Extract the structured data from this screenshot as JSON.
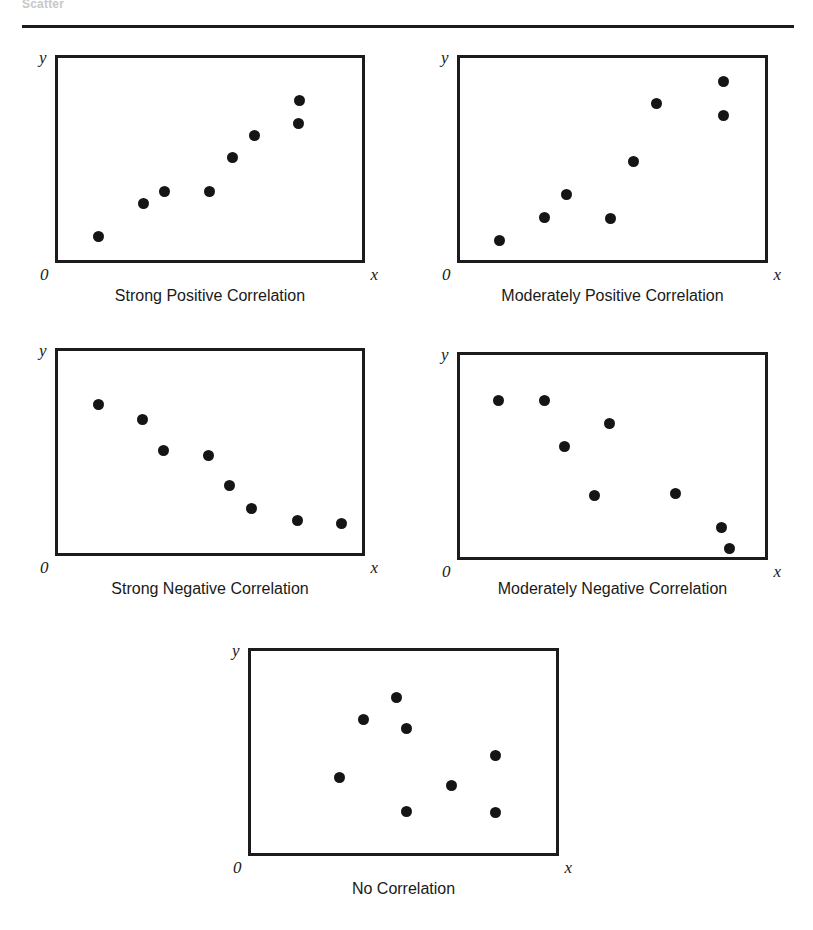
{
  "header": {
    "faint_label": "Scatter",
    "rule": "horizontal-divider"
  },
  "axis": {
    "y_label": "y",
    "x_label": "x",
    "origin_label": "0"
  },
  "chart_data": [
    {
      "type": "scatter",
      "title": "Strong Positive Correlation",
      "xlabel": "x",
      "ylabel": "y",
      "origin": "0",
      "grid": false,
      "legend": "none",
      "xlim": [
        0,
        100
      ],
      "ylim": [
        0,
        100
      ],
      "points": [
        {
          "x": 13.9,
          "y": 12.6
        },
        {
          "x": 28.5,
          "y": 28.8
        },
        {
          "x": 35.4,
          "y": 34.6
        },
        {
          "x": 49.9,
          "y": 34.3
        },
        {
          "x": 57.1,
          "y": 50.8
        },
        {
          "x": 64.2,
          "y": 61.5
        },
        {
          "x": 78.7,
          "y": 67.0
        },
        {
          "x": 78.9,
          "y": 78.3
        }
      ]
    },
    {
      "type": "scatter",
      "title": "Moderately Positive Correlation",
      "xlabel": "x",
      "ylabel": "y",
      "origin": "0",
      "grid": false,
      "legend": "none",
      "xlim": [
        0,
        100
      ],
      "ylim": [
        0,
        100
      ],
      "points": [
        {
          "x": 13.6,
          "y": 10.9
        },
        {
          "x": 28.1,
          "y": 21.8
        },
        {
          "x": 35.2,
          "y": 32.9
        },
        {
          "x": 49.5,
          "y": 21.6
        },
        {
          "x": 56.9,
          "y": 49.0
        },
        {
          "x": 64.2,
          "y": 76.6
        },
        {
          "x": 85.6,
          "y": 87.2
        },
        {
          "x": 85.6,
          "y": 71.0
        }
      ]
    },
    {
      "type": "scatter",
      "title": "Strong Negative Correlation",
      "xlabel": "x",
      "ylabel": "y",
      "origin": "0",
      "grid": false,
      "legend": "none",
      "xlim": [
        0,
        100
      ],
      "ylim": [
        0,
        100
      ],
      "points": [
        {
          "x": 13.9,
          "y": 72.8
        },
        {
          "x": 28.1,
          "y": 65.4
        },
        {
          "x": 34.9,
          "y": 50.6
        },
        {
          "x": 49.5,
          "y": 48.4
        },
        {
          "x": 56.2,
          "y": 33.8
        },
        {
          "x": 63.5,
          "y": 22.6
        },
        {
          "x": 78.3,
          "y": 17.0
        },
        {
          "x": 92.5,
          "y": 15.4
        }
      ]
    },
    {
      "type": "scatter",
      "title": "Moderately Negative Correlation",
      "xlabel": "x",
      "ylabel": "y",
      "origin": "0",
      "grid": false,
      "legend": "none",
      "xlim": [
        0,
        100
      ],
      "ylim": [
        0,
        100
      ],
      "points": [
        {
          "x": 13.3,
          "y": 76.8
        },
        {
          "x": 28.0,
          "y": 76.6
        },
        {
          "x": 34.5,
          "y": 54.5
        },
        {
          "x": 49.0,
          "y": 65.5
        },
        {
          "x": 44.1,
          "y": 30.8
        },
        {
          "x": 70.4,
          "y": 31.9
        },
        {
          "x": 84.9,
          "y": 15.4
        },
        {
          "x": 87.5,
          "y": 5.4
        }
      ]
    },
    {
      "type": "scatter",
      "title": "No Correlation",
      "xlabel": "x",
      "ylabel": "y",
      "origin": "0",
      "grid": false,
      "legend": "none",
      "xlim": [
        0,
        100
      ],
      "ylim": [
        0,
        100
      ],
      "points": [
        {
          "x": 47.9,
          "y": 76.3
        },
        {
          "x": 37.0,
          "y": 65.4
        },
        {
          "x": 51.1,
          "y": 61.5
        },
        {
          "x": 79.5,
          "y": 48.4
        },
        {
          "x": 29.3,
          "y": 37.7
        },
        {
          "x": 65.5,
          "y": 33.8
        },
        {
          "x": 50.9,
          "y": 21.3
        },
        {
          "x": 79.7,
          "y": 20.8
        }
      ]
    }
  ],
  "style": {
    "ink": "#151515",
    "box_border": "#1c1c1c",
    "background": "#ffffff"
  }
}
